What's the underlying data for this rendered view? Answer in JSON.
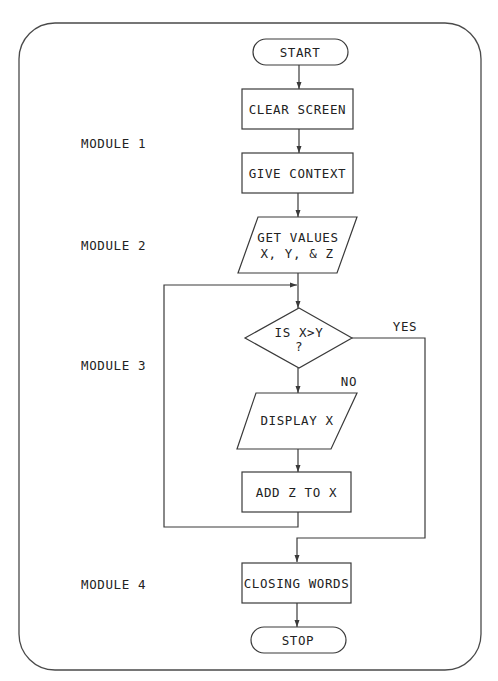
{
  "diagram": {
    "type": "flowchart",
    "modules": [
      {
        "label": "MODULE 1"
      },
      {
        "label": "MODULE 2"
      },
      {
        "label": "MODULE 3"
      },
      {
        "label": "MODULE 4"
      }
    ],
    "nodes": {
      "start": {
        "shape": "terminator",
        "label": "START"
      },
      "clear_screen": {
        "shape": "process",
        "label": "CLEAR SCREEN"
      },
      "give_context": {
        "shape": "process",
        "label": "GIVE CONTEXT"
      },
      "get_values": {
        "shape": "input-output",
        "line1": "GET VALUES",
        "line2": "X, Y, & Z"
      },
      "decision": {
        "shape": "decision",
        "line1": "IS X>Y",
        "line2": "?"
      },
      "display_x": {
        "shape": "input-output",
        "label": "DISPLAY X"
      },
      "add_z": {
        "shape": "process",
        "label": "ADD Z TO X"
      },
      "closing_words": {
        "shape": "process",
        "label": "CLOSING WORDS"
      },
      "stop": {
        "shape": "terminator",
        "label": "STOP"
      }
    },
    "branch_labels": {
      "yes": "YES",
      "no": "NO"
    },
    "edges": [
      {
        "from": "START",
        "to": "CLEAR SCREEN"
      },
      {
        "from": "CLEAR SCREEN",
        "to": "GIVE CONTEXT"
      },
      {
        "from": "GIVE CONTEXT",
        "to": "GET VALUES X, Y, & Z"
      },
      {
        "from": "GET VALUES X, Y, & Z",
        "to": "IS X>Y ?"
      },
      {
        "from": "IS X>Y ?",
        "to": "DISPLAY X",
        "label": "NO"
      },
      {
        "from": "IS X>Y ?",
        "to": "CLOSING WORDS",
        "label": "YES"
      },
      {
        "from": "DISPLAY X",
        "to": "ADD Z TO X"
      },
      {
        "from": "ADD Z TO X",
        "to": "IS X>Y ?",
        "note": "loop back"
      },
      {
        "from": "CLOSING WORDS",
        "to": "STOP"
      }
    ]
  }
}
